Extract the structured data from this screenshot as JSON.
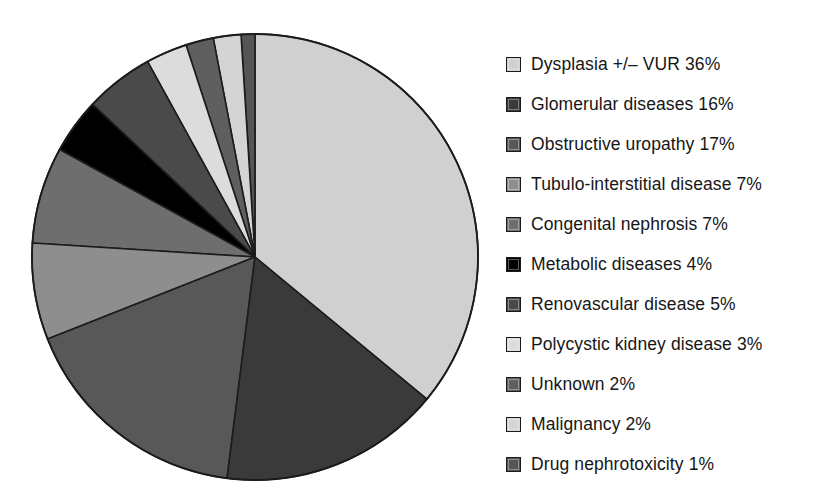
{
  "chart_data": {
    "type": "pie",
    "title": "",
    "subtitle": "",
    "xlabel": "",
    "ylabel": "",
    "grid": false,
    "legend_position": "right",
    "units": "percent",
    "total_percent": 100,
    "start_angle_deg": 0,
    "direction": "clockwise-first-slice-then-counterclockwise",
    "categories": [
      "Dysplasia +/– VUR",
      "Glomerular diseases",
      "Obstructive uropathy",
      "Tubulo-interstitial disease",
      "Congenital nephrosis",
      "Metabolic diseases",
      "Renovascular disease",
      "Polycystic kidney disease",
      "Unknown",
      "Malignancy",
      "Drug nephrotoxicity"
    ],
    "values": [
      36,
      16,
      17,
      7,
      7,
      4,
      5,
      3,
      2,
      2,
      1
    ],
    "colors": [
      "#d0d0d0",
      "#3a3a3a",
      "#585858",
      "#8e8e8e",
      "#6e6e6e",
      "#000000",
      "#4a4a4a",
      "#dcdcdc",
      "#5f5f5f",
      "#d4d4d4",
      "#555555"
    ],
    "slices": [
      {
        "label": "Dysplasia +/– VUR",
        "value": 36,
        "display": "36%",
        "color": "#d0d0d0"
      },
      {
        "label": "Glomerular diseases",
        "value": 16,
        "display": "16%",
        "color": "#3a3a3a"
      },
      {
        "label": "Obstructive uropathy",
        "value": 17,
        "display": "17%",
        "color": "#585858"
      },
      {
        "label": "Tubulo-interstitial disease",
        "value": 7,
        "display": "7%",
        "color": "#8e8e8e"
      },
      {
        "label": "Congenital nephrosis",
        "value": 7,
        "display": "7%",
        "color": "#6e6e6e"
      },
      {
        "label": "Metabolic diseases",
        "value": 4,
        "display": "4%",
        "color": "#000000"
      },
      {
        "label": "Renovascular disease",
        "value": 5,
        "display": "5%",
        "color": "#4a4a4a"
      },
      {
        "label": "Polycystic kidney disease",
        "value": 3,
        "display": "3%",
        "color": "#dcdcdc"
      },
      {
        "label": "Unknown",
        "value": 2,
        "display": "2%",
        "color": "#5f5f5f"
      },
      {
        "label": "Malignancy",
        "value": 2,
        "display": "2%",
        "color": "#d4d4d4"
      },
      {
        "label": "Drug nephrotoxicity",
        "value": 1,
        "display": "1%",
        "color": "#555555"
      }
    ]
  },
  "legend": {
    "items": [
      {
        "text": "Dysplasia +/– VUR 36%",
        "color": "#d0d0d0"
      },
      {
        "text": "Glomerular diseases 16%",
        "color": "#3a3a3a"
      },
      {
        "text": "Obstructive uropathy 17%",
        "color": "#585858"
      },
      {
        "text": "Tubulo-interstitial disease 7%",
        "color": "#8e8e8e"
      },
      {
        "text": "Congenital nephrosis 7%",
        "color": "#6e6e6e"
      },
      {
        "text": "Metabolic diseases 4%",
        "color": "#000000"
      },
      {
        "text": "Renovascular disease 5%",
        "color": "#4a4a4a"
      },
      {
        "text": "Polycystic kidney disease 3%",
        "color": "#dcdcdc"
      },
      {
        "text": "Unknown 2%",
        "color": "#5f5f5f"
      },
      {
        "text": "Malignancy 2%",
        "color": "#d4d4d4"
      },
      {
        "text": "Drug nephrotoxicity 1%",
        "color": "#555555"
      }
    ]
  },
  "style": {
    "background": "#ffffff",
    "slice_outline": "#1c1c1c",
    "text_color": "#161616"
  }
}
